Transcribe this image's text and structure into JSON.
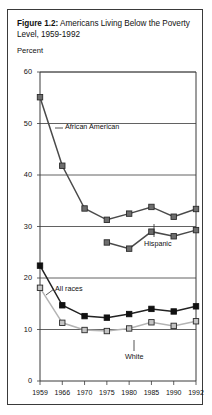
{
  "figure": {
    "label": "Figure 1.2:",
    "caption": " Americans Living Below the Poverty Level, 1959-1992",
    "unit_label": "Percent"
  },
  "chart_data": {
    "type": "line",
    "title": "Americans Living Below the Poverty Level, 1959-1992",
    "xlabel": "",
    "ylabel": "Percent",
    "ylim": [
      0,
      60
    ],
    "ytick_labels": [
      "0",
      "10",
      "20",
      "30",
      "40",
      "50",
      "60"
    ],
    "yticks": [
      0,
      10,
      20,
      30,
      40,
      50,
      60
    ],
    "grid": "horizontal",
    "legend": "annotations",
    "categories": [
      "1959",
      "1966",
      "1970",
      "1975",
      "1980",
      "1985",
      "1990",
      "1992"
    ],
    "series": [
      {
        "name": "African American",
        "marker": "square-gray-filled",
        "color": "#6e6e6e",
        "line_color": "#4a4a4a",
        "values": [
          55.1,
          41.8,
          33.5,
          31.3,
          32.5,
          33.8,
          31.9,
          33.4
        ]
      },
      {
        "name": "Hispanic",
        "marker": "square-gray-filled",
        "color": "#6e6e6e",
        "line_color": "#4a4a4a",
        "values": [
          null,
          null,
          null,
          26.9,
          25.7,
          29.0,
          28.1,
          29.3
        ]
      },
      {
        "name": "All races",
        "marker": "square-black-filled",
        "color": "#111111",
        "line_color": "#222222",
        "values": [
          22.4,
          14.7,
          12.6,
          12.3,
          13.0,
          14.0,
          13.5,
          14.5
        ]
      },
      {
        "name": "White",
        "marker": "square-lightgray-outline",
        "color": "#c4c4c4",
        "line_color": "#b4b4b4",
        "values": [
          18.1,
          11.3,
          9.9,
          9.7,
          10.2,
          11.4,
          10.7,
          11.6
        ]
      }
    ],
    "annotations": [
      {
        "text": "African American",
        "series": "African American"
      },
      {
        "text": "Hispanic",
        "series": "Hispanic"
      },
      {
        "text": "All races",
        "series": "All races"
      },
      {
        "text": "White",
        "series": "White"
      }
    ]
  }
}
